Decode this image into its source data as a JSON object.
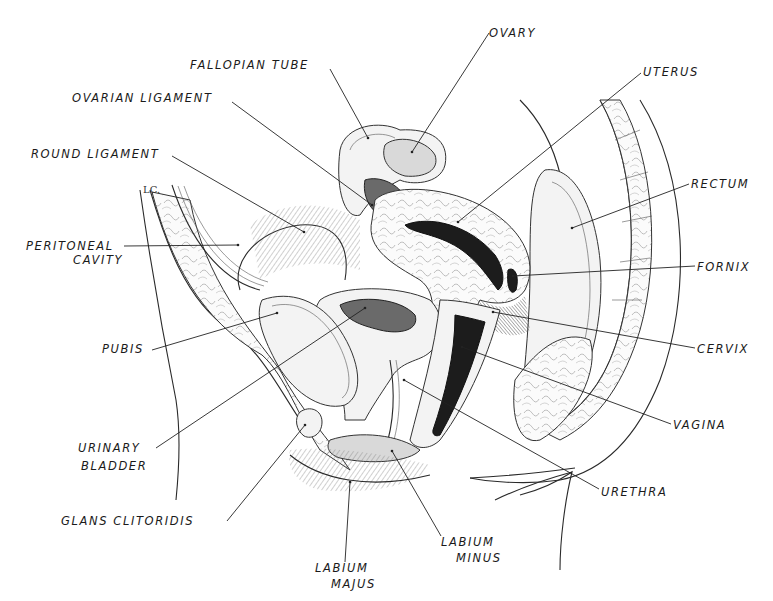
{
  "diagram": {
    "type": "anatomical-sagittal-section",
    "signature": "LC.",
    "labels": [
      {
        "id": "fallopian_tube",
        "text": "FALLOPIAN TUBE",
        "x": 190,
        "y": 69,
        "anchor": "start",
        "line": [
          330,
          69,
          368,
          138
        ]
      },
      {
        "id": "ovary",
        "text": "OVARY",
        "x": 489,
        "y": 37,
        "anchor": "start",
        "line": [
          489,
          33,
          412,
          152
        ]
      },
      {
        "id": "ovarian_ligament",
        "text": "OVARIAN LIGAMENT",
        "x": 72,
        "y": 102,
        "anchor": "start",
        "line": [
          232,
          102,
          372,
          205
        ]
      },
      {
        "id": "uterus",
        "text": "UTERUS",
        "x": 643,
        "y": 76,
        "anchor": "start",
        "line": [
          641,
          73,
          458,
          222
        ]
      },
      {
        "id": "round_ligament",
        "text": "ROUND LIGAMENT",
        "x": 31,
        "y": 158,
        "anchor": "start",
        "line": [
          172,
          156,
          304,
          232
        ]
      },
      {
        "id": "rectum",
        "text": "RECTUM",
        "x": 691,
        "y": 188,
        "anchor": "start",
        "line": [
          689,
          184,
          572,
          228
        ]
      },
      {
        "id": "peritoneal_cavity",
        "text": "PERITONEAL",
        "x": 26,
        "y": 250,
        "anchor": "start",
        "line": [
          124,
          246,
          238,
          245
        ]
      },
      {
        "id": "peritoneal_cavity_2",
        "text": "CAVITY",
        "x": 73,
        "y": 264,
        "anchor": "start",
        "line": null
      },
      {
        "id": "fornix",
        "text": "FORNIX",
        "x": 697,
        "y": 271,
        "anchor": "start",
        "line": [
          695,
          266,
          513,
          276
        ]
      },
      {
        "id": "pubis",
        "text": "PUBIS",
        "x": 102,
        "y": 353,
        "anchor": "start",
        "line": [
          152,
          350,
          277,
          313
        ]
      },
      {
        "id": "cervix",
        "text": "CERVIX",
        "x": 697,
        "y": 353,
        "anchor": "start",
        "line": [
          695,
          348,
          493,
          312
        ]
      },
      {
        "id": "vagina",
        "text": "VAGINA",
        "x": 673,
        "y": 429,
        "anchor": "start",
        "line": [
          671,
          424,
          462,
          347
        ]
      },
      {
        "id": "urinary_bladder",
        "text": "URINARY",
        "x": 78,
        "y": 452,
        "anchor": "start",
        "line": [
          156,
          448,
          365,
          308
        ]
      },
      {
        "id": "urinary_bladder_2",
        "text": "BLADDER",
        "x": 81,
        "y": 470,
        "anchor": "start",
        "line": null
      },
      {
        "id": "urethra",
        "text": "URETHRA",
        "x": 601,
        "y": 496,
        "anchor": "start",
        "line": [
          599,
          489,
          404,
          380
        ]
      },
      {
        "id": "glans_clitoridis",
        "text": "GLANS CLITORIDIS",
        "x": 61,
        "y": 525,
        "anchor": "start",
        "line": [
          227,
          521,
          305,
          425
        ]
      },
      {
        "id": "labium_minus",
        "text": "LABIUM",
        "x": 441,
        "y": 546,
        "anchor": "start",
        "line": [
          441,
          536,
          392,
          451
        ]
      },
      {
        "id": "labium_minus_2",
        "text": "MINUS",
        "x": 456,
        "y": 562,
        "anchor": "start",
        "line": null
      },
      {
        "id": "labium_majus",
        "text": "LABIUM",
        "x": 315,
        "y": 572,
        "anchor": "start",
        "line": [
          345,
          562,
          350,
          482
        ]
      },
      {
        "id": "labium_majus_2",
        "text": "MAJUS",
        "x": 331,
        "y": 588,
        "anchor": "start",
        "line": null
      }
    ]
  }
}
